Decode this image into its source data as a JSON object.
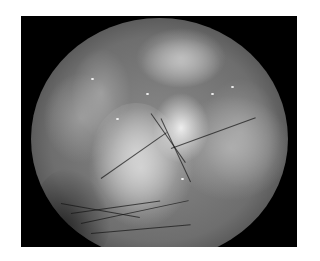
{
  "image": {
    "description": "Grayscale endoscopic view within a circular field of view on a black square frame, showing glistening tissue folds with dark fine hair-like strands in the lower portion",
    "colors": {
      "background": "#ffffff",
      "frame": "#000000",
      "tissue_mid": "#8c8c8c",
      "tissue_highlight": "#e6e6e6"
    }
  }
}
